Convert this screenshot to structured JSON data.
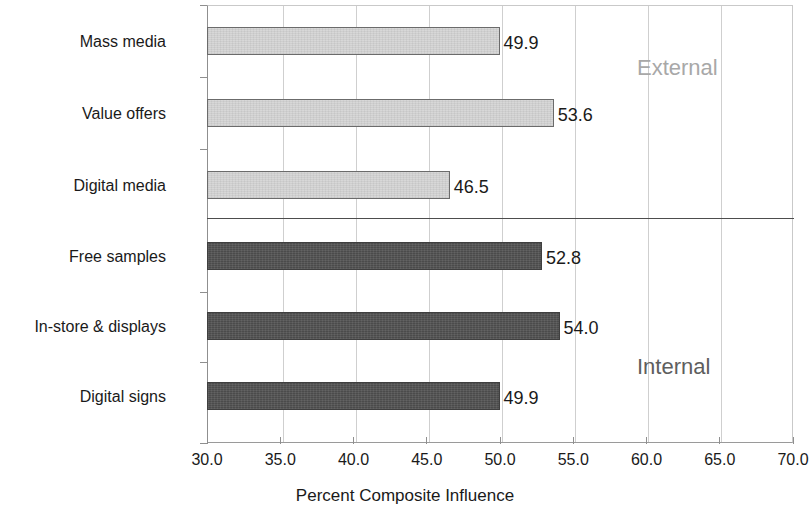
{
  "chart_data": {
    "type": "bar",
    "orientation": "horizontal",
    "title": "",
    "xlabel": "Percent Composite Influence",
    "ylabel": "",
    "xlim": [
      30.0,
      70.0
    ],
    "xticks": [
      "30.0",
      "35.0",
      "40.0",
      "45.0",
      "50.0",
      "55.0",
      "60.0",
      "65.0",
      "70.0"
    ],
    "xtick_values": [
      30.0,
      35.0,
      40.0,
      45.0,
      50.0,
      55.0,
      60.0,
      65.0,
      70.0
    ],
    "grid": "vertical",
    "legend": "none",
    "categories": [
      "Mass media",
      "Value offers",
      "Digital media",
      "Free samples",
      "In-store & displays",
      "Digital signs"
    ],
    "values": [
      49.9,
      53.6,
      46.5,
      52.8,
      54.0,
      49.9
    ],
    "value_labels": [
      "49.9",
      "53.6",
      "46.5",
      "52.8",
      "54.0",
      "49.9"
    ],
    "bars": [
      {
        "category": "Mass media",
        "value": 49.9,
        "label": "49.9",
        "group": "External",
        "style": "light"
      },
      {
        "category": "Value offers",
        "value": 53.6,
        "label": "53.6",
        "group": "External",
        "style": "light"
      },
      {
        "category": "Digital media",
        "value": 46.5,
        "label": "46.5",
        "group": "External",
        "style": "light"
      },
      {
        "category": "Free samples",
        "value": 52.8,
        "label": "52.8",
        "group": "Internal",
        "style": "dark"
      },
      {
        "category": "In-store & displays",
        "value": 54.0,
        "label": "54.0",
        "group": "Internal",
        "style": "dark"
      },
      {
        "category": "Digital signs",
        "value": 49.9,
        "label": "49.9",
        "group": "Internal",
        "style": "dark"
      }
    ],
    "annotations": [
      {
        "text": "External",
        "group": "External"
      },
      {
        "text": "Internal",
        "group": "Internal"
      }
    ],
    "colors": {
      "light_bar": "#d4d4d4",
      "dark_bar": "#545454",
      "bar_outline": "#5a5a5a",
      "gridline": "#cfcfcf",
      "axis": "#8f8f8f",
      "divider": "#4d4d4d",
      "text": "#1a1a1a",
      "external_note": "#a8a8a8",
      "internal_note": "#5e5e5e",
      "background": "#ffffff"
    }
  },
  "axis_title": {
    "text": "Percent Composite Influence"
  }
}
